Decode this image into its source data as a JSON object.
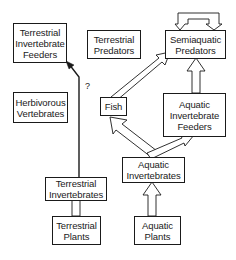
{
  "diagram": {
    "type": "food-web",
    "nodes": [
      {
        "id": "terrestrial-invertebrate-feeders",
        "label": "Terrestrial\nInvertebrate\nFeeders"
      },
      {
        "id": "terrestrial-predators",
        "label": "Terrestrial\nPredators"
      },
      {
        "id": "semiaquatic-predators",
        "label": "Semiaquatic\nPredators"
      },
      {
        "id": "herbivorous-vertebrates",
        "label": "Herbivorous\nVertebrates"
      },
      {
        "id": "fish",
        "label": "Fish"
      },
      {
        "id": "aquatic-invertebrate-feeders",
        "label": "Aquatic\nInvertebrate\nFeeders"
      },
      {
        "id": "terrestrial-invertebrates",
        "label": "Terrestrial\nInvertebrates"
      },
      {
        "id": "aquatic-invertebrates",
        "label": "Aquatic\nInvertebrates"
      },
      {
        "id": "terrestrial-plants",
        "label": "Terrestrial\nPlants"
      },
      {
        "id": "aquatic-plants",
        "label": "Aquatic\nPlants"
      }
    ],
    "edges": [
      {
        "from": "terrestrial-plants",
        "to": "terrestrial-invertebrates",
        "style": "hollow-arrow"
      },
      {
        "from": "aquatic-plants",
        "to": "aquatic-invertebrates",
        "style": "hollow-arrow"
      },
      {
        "from": "aquatic-invertebrates",
        "to": "fish",
        "style": "hollow-arrow"
      },
      {
        "from": "aquatic-invertebrates",
        "to": "aquatic-invertebrate-feeders",
        "style": "hollow-arrow"
      },
      {
        "from": "fish",
        "to": "semiaquatic-predators",
        "style": "hollow-arrow"
      },
      {
        "from": "aquatic-invertebrate-feeders",
        "to": "semiaquatic-predators",
        "style": "hollow-arrow"
      },
      {
        "from": "semiaquatic-predators",
        "to": "semiaquatic-predators",
        "style": "hollow-loop"
      },
      {
        "from": "terrestrial-invertebrates",
        "to": "terrestrial-invertebrate-feeders",
        "style": "solid-line-arrow",
        "label": "?"
      }
    ],
    "uncertain_link_label": "?",
    "colors": {
      "stroke": "#1a1a1a",
      "background": "#ffffff"
    }
  }
}
